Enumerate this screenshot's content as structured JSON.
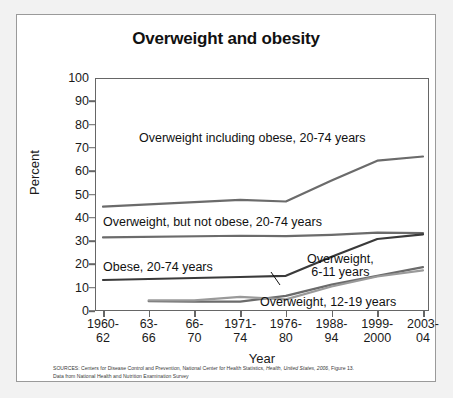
{
  "figure": {
    "title": "Overweight and obesity",
    "source_line_1_prefix": "SOURCES: Centers for Disease Control and Prevention, National Center for Health Statistics, ",
    "source_line_1_italic": "Health, United States, 2006",
    "source_line_1_suffix": ", Figure 13.",
    "source_line_2": "Data from National Health and Nutrition Examination Survey"
  },
  "chart_data": {
    "type": "line",
    "title": "Overweight and obesity",
    "xlabel": "Year",
    "ylabel": "Percent",
    "ylim": [
      0,
      100
    ],
    "ytick_step": 10,
    "yticks": [
      0,
      10,
      20,
      30,
      40,
      50,
      60,
      70,
      80,
      90,
      100
    ],
    "grid": false,
    "legend_position": "inline-annotations",
    "categories": [
      "1960-62",
      "63-66",
      "66-70",
      "1971-74",
      "1976-80",
      "1988-94",
      "1999-2000",
      "2003-04"
    ],
    "category_lines": [
      [
        "1960-",
        "62"
      ],
      [
        "63-",
        "66"
      ],
      [
        "66-",
        "70"
      ],
      [
        "1971-",
        "74"
      ],
      [
        "1976-",
        "80"
      ],
      [
        "1988-",
        "94"
      ],
      [
        "1999-",
        "2000"
      ],
      [
        "2003-",
        "04"
      ]
    ],
    "series": [
      {
        "name": "Overweight including obese, 20-74 years",
        "color": "#6b6b6b",
        "values": [
          44.8,
          null,
          null,
          47.7,
          47.0,
          56.0,
          64.5,
          66.3
        ]
      },
      {
        "name": "Overweight, but not obese, 20-74 years",
        "color": "#6b6b6b",
        "values": [
          31.6,
          null,
          null,
          32.3,
          32.1,
          32.7,
          33.6,
          33.4
        ]
      },
      {
        "name": "Obese, 20-74 years",
        "color": "#3a3a3a",
        "values": [
          13.3,
          null,
          null,
          14.6,
          15.1,
          23.3,
          30.9,
          32.9
        ]
      },
      {
        "name": "Overweight, 6-11 years",
        "color": "#6b6b6b",
        "values": [
          null,
          4.2,
          4.0,
          4.0,
          6.5,
          11.3,
          15.1,
          18.8
        ]
      },
      {
        "name": "Overweight, 12-19 years",
        "color": "#9a9a9a",
        "values": [
          null,
          4.6,
          4.6,
          6.1,
          5.0,
          10.5,
          14.8,
          17.4
        ]
      }
    ],
    "annotations": [
      {
        "text": "Overweight including obese, 20-74 years",
        "x_px": 122,
        "y_px": 117
      },
      {
        "text": "Overweight, but not obese, 20-74 years",
        "x_px": 86,
        "y_px": 201
      },
      {
        "text": "Obese, 20-74 years",
        "x_px": 86,
        "y_px": 246
      },
      {
        "text_line1": "Overweight,",
        "text_line2": "6-11 years",
        "x_px": 290,
        "y_px": 238
      },
      {
        "text": "Overweight, 12-19 years",
        "x_px": 243,
        "y_px": 281
      }
    ]
  }
}
